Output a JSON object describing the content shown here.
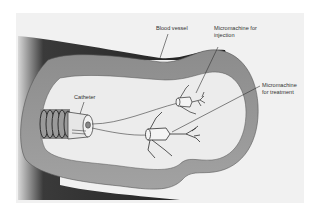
{
  "diagram": {
    "type": "illustration",
    "colors": {
      "background": "#f1f1f1",
      "vessel_outer_dark": "#2a2a2a",
      "vessel_wall": "#9a9a9a",
      "vessel_lumen": "#ececec",
      "line": "#3a3a3a"
    },
    "labels": {
      "blood_vessel": "Blood vessel",
      "micromachine_injection_line1": "Micromachine for",
      "micromachine_injection_line2": "injection",
      "micromachine_treatment_line1": "Micromachine",
      "micromachine_treatment_line2": "for treatment",
      "catheter": "Catheter"
    },
    "components": [
      {
        "id": "blood-vessel",
        "label": "Blood vessel"
      },
      {
        "id": "catheter",
        "label": "Catheter"
      },
      {
        "id": "micromachine-injection",
        "label": "Micromachine for injection"
      },
      {
        "id": "micromachine-treatment",
        "label": "Micromachine for treatment"
      }
    ]
  }
}
